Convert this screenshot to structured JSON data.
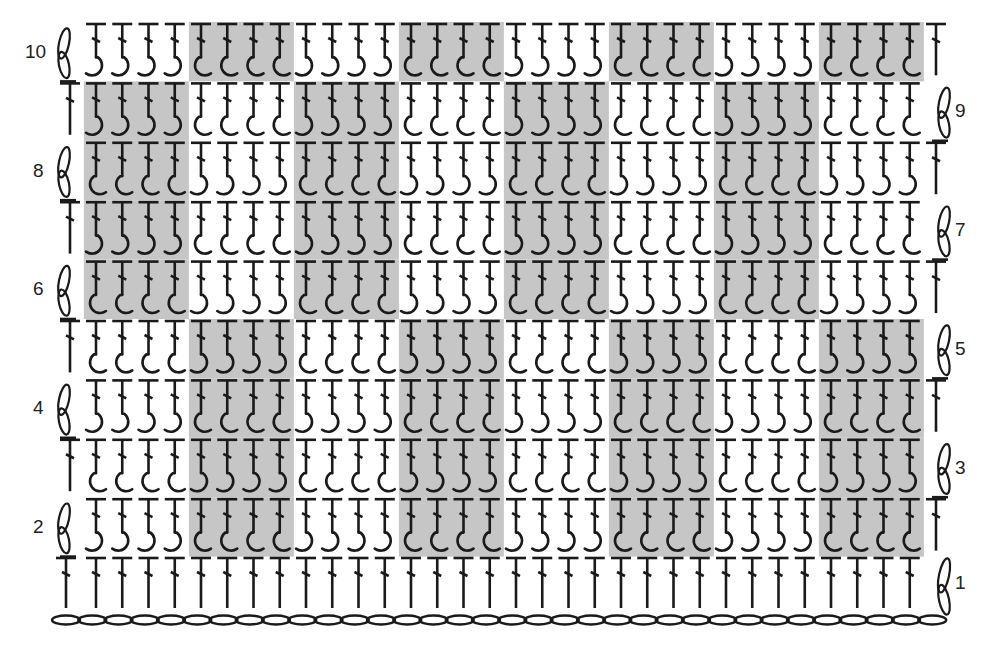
{
  "diagram": {
    "type": "crochet-stitch-chart",
    "rows": 10,
    "hook_columns": 32,
    "block_width": 4,
    "blocks_per_row": 8,
    "colors": {
      "ink": "#1a1a1a",
      "shade": "#c6c6c6",
      "background": "#ffffff"
    },
    "row_labels": [
      {
        "row": 1,
        "label": "1",
        "side": "right"
      },
      {
        "row": 2,
        "label": "2",
        "side": "left"
      },
      {
        "row": 3,
        "label": "3",
        "side": "right"
      },
      {
        "row": 4,
        "label": "4",
        "side": "left"
      },
      {
        "row": 5,
        "label": "5",
        "side": "right"
      },
      {
        "row": 6,
        "label": "6",
        "side": "left"
      },
      {
        "row": 7,
        "label": "7",
        "side": "right"
      },
      {
        "row": 8,
        "label": "8",
        "side": "left"
      },
      {
        "row": 9,
        "label": "9",
        "side": "right"
      },
      {
        "row": 10,
        "label": "10",
        "side": "left"
      }
    ],
    "shaded_blocks_by_row": {
      "2": [
        2,
        4,
        6,
        8
      ],
      "3": [
        2,
        4,
        6,
        8
      ],
      "4": [
        2,
        4,
        6,
        8
      ],
      "5": [
        2,
        4,
        6,
        8
      ],
      "6": [
        1,
        3,
        5,
        7
      ],
      "7": [
        1,
        3,
        5,
        7
      ],
      "8": [
        1,
        3,
        5,
        7
      ],
      "9": [
        1,
        3,
        5,
        7
      ],
      "10": [
        2,
        4,
        6,
        8
      ]
    },
    "stitch_legend": {
      "foundation": "chain",
      "row_1": "double crochet",
      "turning_chain_odd_rows": "chain-2 loop on right",
      "turning_chain_even_rows": "chain-2 loop on left",
      "hook_rule": "odd rows: shaded = front-post hook (bulb right), plain = back-post hook (bulb left); even rows reversed"
    }
  }
}
